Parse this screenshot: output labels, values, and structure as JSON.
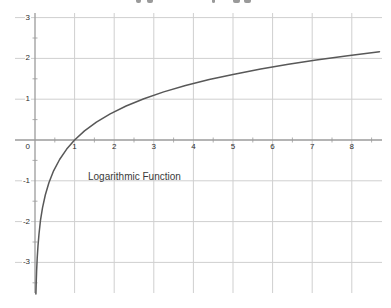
{
  "page": {
    "background": "#ffffff",
    "top_edge_note": "unreadable cropped text fragments along top edge"
  },
  "chart_data": {
    "type": "line",
    "annotation": "Logarithmic Function",
    "function_label": "y = ln(x)",
    "grid": true,
    "legend": "none",
    "origin_label": "0",
    "x_tick_values": [
      1,
      2,
      3,
      4,
      5,
      6,
      7,
      8
    ],
    "y_tick_values": [
      3,
      2,
      1,
      -1,
      -2,
      -3
    ],
    "x_minor_ticks": [
      0.5,
      1.5,
      2.5,
      3.5,
      4.5,
      5.5,
      6.5,
      7.5,
      8.5
    ],
    "y_minor_ticks": [
      2.5,
      1.5,
      0.5,
      -0.5,
      -1.5,
      -2.5,
      -3.5
    ],
    "xlim": [
      -0.55,
      8.75
    ],
    "ylim": [
      -3.75,
      3.1
    ],
    "xlabel": "",
    "ylabel": "",
    "title": "",
    "series": [
      {
        "name": "ln(x)",
        "x": [
          0.023,
          0.03,
          0.04,
          0.055,
          0.075,
          0.1,
          0.14,
          0.19,
          0.26,
          0.35,
          0.47,
          0.62,
          0.8,
          1.0,
          1.25,
          1.55,
          1.9,
          2.3,
          2.75,
          3.25,
          3.8,
          4.4,
          5.0,
          5.7,
          6.4,
          7.1,
          7.9,
          8.7
        ],
        "y": [
          -3.772,
          -3.507,
          -3.219,
          -2.9,
          -2.59,
          -2.303,
          -1.966,
          -1.661,
          -1.347,
          -1.05,
          -0.755,
          -0.478,
          -0.223,
          0,
          0.223,
          0.438,
          0.642,
          0.833,
          1.012,
          1.179,
          1.335,
          1.482,
          1.609,
          1.74,
          1.856,
          1.96,
          2.067,
          2.163
        ]
      }
    ],
    "colors": {
      "grid": "#cfcfcf",
      "axis": "#9b9b9b",
      "curve": "#585858",
      "label": "#2e2e2e"
    }
  },
  "top_edge_artifacts": [
    {
      "x": 136,
      "w": 5
    },
    {
      "x": 147,
      "w": 6
    },
    {
      "x": 212,
      "w": 3
    },
    {
      "x": 233,
      "w": 7
    },
    {
      "x": 244,
      "w": 7
    }
  ]
}
